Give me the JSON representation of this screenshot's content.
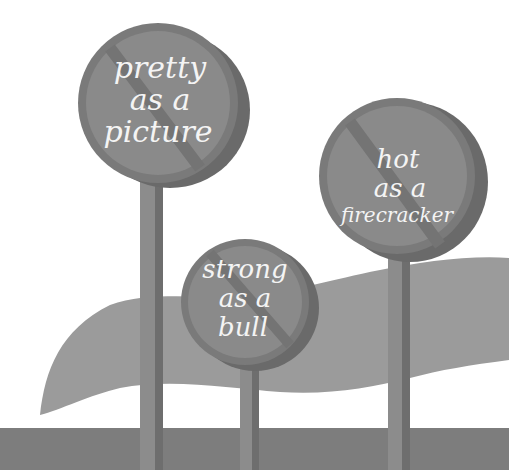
{
  "scene": {
    "description": "Illustration of three prohibition road signs on poles over a hill and ground band",
    "colors": {
      "background": "#ffffff",
      "sign_face": "#8a8a8a",
      "sign_rim": "#7a7a7a",
      "sign_shadow": "#6a6a6a",
      "slash": "#747474",
      "pole": "#8c8c8c",
      "pole_shadow": "#6e6e6e",
      "hill": "#9b9b9b",
      "ground": "#7d7d7d",
      "text": "#f4f4f4"
    }
  },
  "signs": [
    {
      "id": "pretty",
      "lines": [
        "pretty",
        "as a",
        "picture"
      ]
    },
    {
      "id": "strong",
      "lines": [
        "strong",
        "as a",
        "bull"
      ]
    },
    {
      "id": "hot",
      "lines": [
        "hot",
        "as a",
        "firecracker"
      ]
    }
  ]
}
